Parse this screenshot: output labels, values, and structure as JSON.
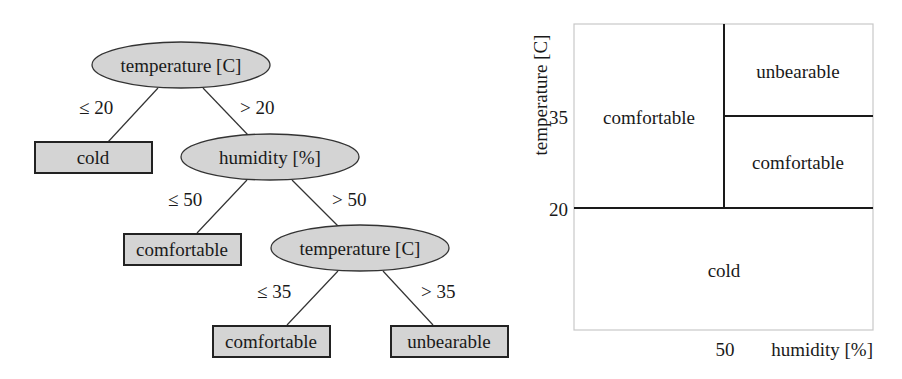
{
  "tree": {
    "root": {
      "label": "temperature [C]"
    },
    "nodes": {
      "humidity": {
        "label": "humidity [%]"
      },
      "temp2": {
        "label": "temperature [C]"
      }
    },
    "leaves": {
      "cold": {
        "label": "cold"
      },
      "comfortable1": {
        "label": "comfortable"
      },
      "comfortable2": {
        "label": "comfortable"
      },
      "unbearable": {
        "label": "unbearable"
      }
    },
    "edges": {
      "root_le": "≤ 20",
      "root_gt": "> 20",
      "hum_le": "≤ 50",
      "hum_gt": "> 50",
      "temp2_le": "≤ 35",
      "temp2_gt": "> 35"
    },
    "colors": {
      "node_fill": "#d4d4d4",
      "stroke": "#222222"
    }
  },
  "partition": {
    "ylabel": "temperature [C]",
    "xlabel": "humidity [%]",
    "yticks": [
      "35",
      "20"
    ],
    "xticks": [
      "50"
    ],
    "regions": {
      "left_comfortable": "comfortable",
      "top_right_unbearable": "unbearable",
      "mid_right_comfortable": "comfortable",
      "bottom_cold": "cold"
    }
  }
}
